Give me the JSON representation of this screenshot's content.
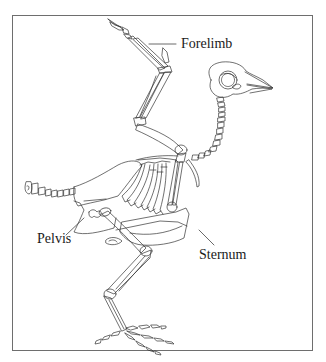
{
  "diagram": {
    "labels": {
      "forelimb": "Forelimb",
      "pelvis": "Pelvis",
      "sternum": "Sternum"
    },
    "colors": {
      "line": "#333333",
      "frame": "#6e6e6e",
      "background": "#ffffff"
    }
  }
}
